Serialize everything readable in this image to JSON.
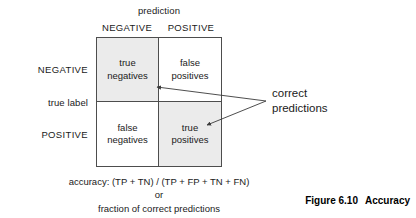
{
  "figure": {
    "caption_number": "Figure 6.10",
    "caption_title": "Accuracy"
  },
  "axes": {
    "column_axis_title": "prediction",
    "row_axis_title": "true label",
    "column_headers": [
      "NEGATIVE",
      "POSITIVE"
    ],
    "row_headers": [
      "NEGATIVE",
      "POSITIVE"
    ]
  },
  "matrix": {
    "cells": [
      {
        "line1": "true",
        "line2": "negatives",
        "shaded": true,
        "key": "true-negatives"
      },
      {
        "line1": "false",
        "line2": "positives",
        "shaded": false,
        "key": "false-positives"
      },
      {
        "line1": "false",
        "line2": "negatives",
        "shaded": false,
        "key": "false-negatives"
      },
      {
        "line1": "true",
        "line2": "positives",
        "shaded": true,
        "key": "true-positives"
      }
    ]
  },
  "annotation": {
    "line1": "correct",
    "line2": "predictions"
  },
  "formula": {
    "line1": "accuracy: (TP + TN) / (TP + FP + TN + FN)",
    "line2": "or",
    "line3": "fraction of correct predictions"
  },
  "colors": {
    "shaded_cell": "#ebebeb",
    "border": "#4d4d4d",
    "text": "#1a1a1a"
  }
}
